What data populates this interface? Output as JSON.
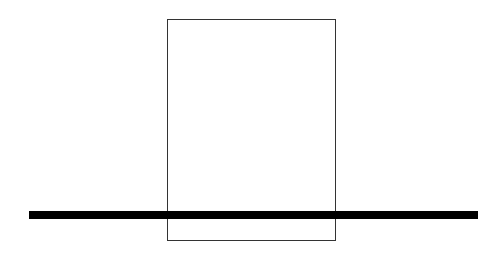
{
  "diagram": {
    "shapes": [
      {
        "type": "rectangle",
        "label": "",
        "x": 167,
        "y": 19,
        "width": 169,
        "height": 222,
        "stroke": "#333333",
        "fill": "none"
      },
      {
        "type": "thick-horizontal-line",
        "label": "",
        "x1": 29,
        "x2": 478,
        "y": 215,
        "thickness": 8,
        "color": "#000000"
      }
    ]
  }
}
